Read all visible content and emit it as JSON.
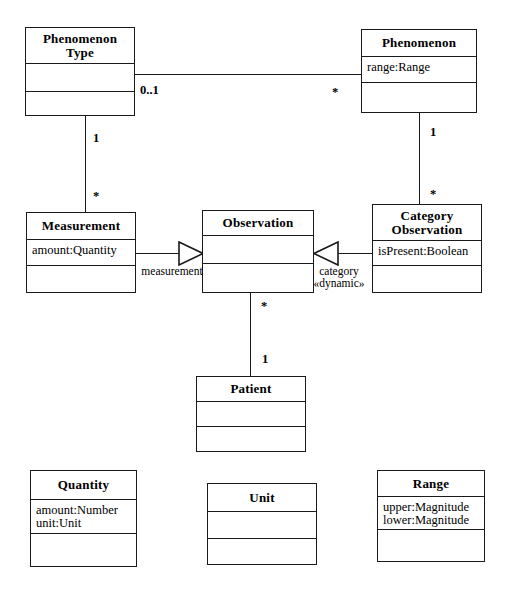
{
  "diagram": {
    "stroke_color": "#1a1a1a",
    "background_color": "#ffffff",
    "classes": [
      {
        "id": "phenomenon-type",
        "name": "Phenomenon\nType",
        "attributes": "",
        "operations": ""
      },
      {
        "id": "phenomenon",
        "name": "Phenomenon",
        "attributes": "range:Range",
        "operations": ""
      },
      {
        "id": "measurement",
        "name": "Measurement",
        "attributes": "amount:Quantity",
        "operations": ""
      },
      {
        "id": "observation",
        "name": "Observation",
        "attributes": "",
        "operations": ""
      },
      {
        "id": "category-observation",
        "name": "Category\nObservation",
        "attributes": "isPresent:Boolean",
        "operations": ""
      },
      {
        "id": "patient",
        "name": "Patient",
        "attributes": "",
        "operations": ""
      },
      {
        "id": "quantity",
        "name": "Quantity",
        "attributes": "amount:Number\nunit:Unit",
        "operations": ""
      },
      {
        "id": "unit",
        "name": "Unit",
        "attributes": "",
        "operations": ""
      },
      {
        "id": "range",
        "name": "Range",
        "attributes": "upper:Magnitude\nlower:Magnitude",
        "operations": ""
      }
    ],
    "multiplicities": {
      "phenomenontype_to_phenomenon_near": "0..1",
      "phenomenontype_to_phenomenon_far": "*",
      "phenomenontype_to_measurement_near": "1",
      "phenomenontype_to_measurement_far": "*",
      "phenomenon_to_categoryobs_near": "1",
      "phenomenon_to_categoryobs_far": "*",
      "observation_to_patient_near": "*",
      "observation_to_patient_far": "1"
    },
    "role_labels": {
      "measurement_role": "measurement",
      "category_role": "category\n«dynamic»"
    }
  }
}
